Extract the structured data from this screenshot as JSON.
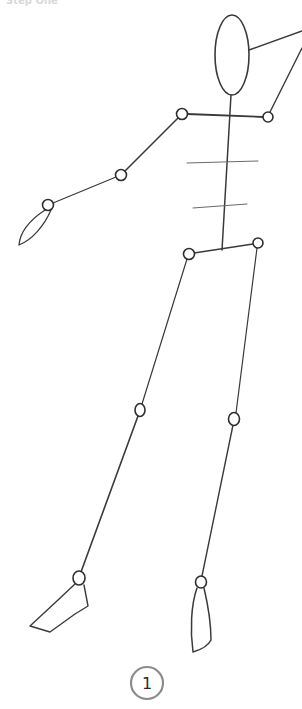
{
  "image": {
    "description": "Pencil sketch of a stick figure with oval head, jointed limbs and two rib lines",
    "background": "#ffffff",
    "stroke_color": "#3a3a3a"
  },
  "top_text": {
    "text": "Step One",
    "visibility": "faint, cropped at top edge"
  },
  "figure": {
    "head": {
      "cx": 232,
      "cy": 55,
      "rx": 17,
      "ry": 40
    },
    "neck_line": {
      "x1": 259,
      "y1": 52,
      "x2": 302,
      "y2": 31
    },
    "spine": {
      "x1": 231,
      "y1": 95,
      "x2": 222,
      "y2": 250
    },
    "shoulders": {
      "x1": 182,
      "y1": 114,
      "x2": 268,
      "y2": 117
    },
    "ribs": [
      {
        "x1": 187,
        "y1": 163,
        "x2": 258,
        "y2": 161
      },
      {
        "x1": 193,
        "y1": 208,
        "x2": 247,
        "y2": 204
      }
    ],
    "hips": {
      "x1": 189,
      "y1": 254,
      "x2": 258,
      "y2": 243
    },
    "joints": [
      {
        "name": "left-shoulder",
        "cx": 182,
        "cy": 114,
        "r": 5.5
      },
      {
        "name": "right-shoulder",
        "cx": 268,
        "cy": 117,
        "r": 5
      },
      {
        "name": "left-elbow",
        "cx": 121,
        "cy": 175,
        "r": 5.5
      },
      {
        "name": "left-wrist",
        "cx": 48,
        "cy": 205,
        "r": 5.5
      },
      {
        "name": "left-hip",
        "cx": 189,
        "cy": 254,
        "r": 5.5
      },
      {
        "name": "right-hip",
        "cx": 258,
        "cy": 243,
        "r": 5
      },
      {
        "name": "left-knee",
        "cx": 140,
        "cy": 410,
        "r": 5.5
      },
      {
        "name": "right-knee",
        "cx": 234,
        "cy": 419,
        "r": 5.5
      },
      {
        "name": "left-ankle",
        "cx": 79,
        "cy": 578,
        "r": 6
      },
      {
        "name": "right-ankle",
        "cx": 201,
        "cy": 582,
        "r": 5.5
      }
    ]
  },
  "step_badge": {
    "label": "1",
    "cx": 147,
    "cy": 683,
    "r": 16
  }
}
